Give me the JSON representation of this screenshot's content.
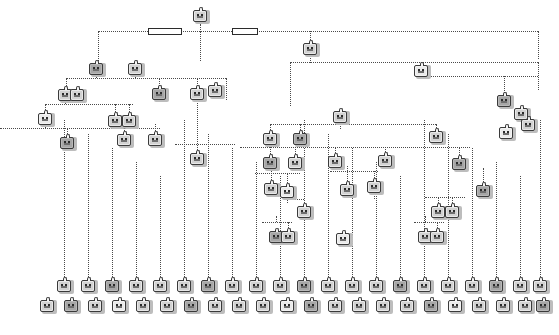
{
  "diagram": {
    "kind": "tree",
    "node_icon": "briefcase-face-icon",
    "connector_style": "dotted",
    "colors": {
      "connector": "#4a4a4a",
      "node_border": "#3a3a3a",
      "node_fill": "#e8e8e8",
      "node_shadow": "#bdbdbd",
      "label_box_border": "#2b2b2b",
      "label_box_fill": "#ffffff",
      "background": "#ffffff",
      "caption": "#8d8d8d"
    },
    "counts": {
      "total_nodes": 118,
      "leaf_row_upper": 21,
      "leaf_row_lower": 22,
      "label_boxes": 2
    },
    "label_boxes": [
      {
        "x": 148,
        "y": 28,
        "w": 34,
        "h": 7,
        "text": ""
      },
      {
        "x": 232,
        "y": 28,
        "w": 26,
        "h": 7,
        "text": ""
      }
    ],
    "nodes": [
      {
        "id": "n0",
        "x": 193,
        "y": 7,
        "v": ""
      },
      {
        "id": "n1",
        "x": 303,
        "y": 40,
        "v": ""
      },
      {
        "id": "n2",
        "x": 89,
        "y": 60,
        "v": ""
      },
      {
        "id": "n3",
        "x": 128,
        "y": 60,
        "v": ""
      },
      {
        "id": "n4",
        "x": 414,
        "y": 62,
        "v": ""
      },
      {
        "id": "n5",
        "x": 58,
        "y": 86,
        "v": ""
      },
      {
        "id": "n6",
        "x": 70,
        "y": 86,
        "v": ""
      },
      {
        "id": "n7",
        "x": 152,
        "y": 85,
        "v": ""
      },
      {
        "id": "n8",
        "x": 190,
        "y": 85,
        "v": ""
      },
      {
        "id": "n9",
        "x": 208,
        "y": 82,
        "v": ""
      },
      {
        "id": "n10",
        "x": 333,
        "y": 108,
        "v": ""
      },
      {
        "id": "n11",
        "x": 497,
        "y": 92,
        "v": ""
      },
      {
        "id": "n12",
        "x": 514,
        "y": 105,
        "v": ""
      },
      {
        "id": "n13",
        "x": 38,
        "y": 110,
        "v": ""
      },
      {
        "id": "n14",
        "x": 108,
        "y": 112,
        "v": ""
      },
      {
        "id": "n15",
        "x": 122,
        "y": 112,
        "v": ""
      },
      {
        "id": "n16",
        "x": 60,
        "y": 134,
        "v": ""
      },
      {
        "id": "n17",
        "x": 117,
        "y": 131,
        "v": ""
      },
      {
        "id": "n18",
        "x": 148,
        "y": 131,
        "v": ""
      },
      {
        "id": "n19",
        "x": 263,
        "y": 130,
        "v": ""
      },
      {
        "id": "n20",
        "x": 293,
        "y": 130,
        "v": ""
      },
      {
        "id": "n21",
        "x": 429,
        "y": 128,
        "v": ""
      },
      {
        "id": "n22",
        "x": 499,
        "y": 124,
        "v": ""
      },
      {
        "id": "n23",
        "x": 521,
        "y": 116,
        "v": ""
      },
      {
        "id": "n24",
        "x": 190,
        "y": 150,
        "v": ""
      },
      {
        "id": "n25",
        "x": 263,
        "y": 154,
        "v": ""
      },
      {
        "id": "n26",
        "x": 288,
        "y": 154,
        "v": ""
      },
      {
        "id": "n27",
        "x": 328,
        "y": 153,
        "v": ""
      },
      {
        "id": "n28",
        "x": 378,
        "y": 152,
        "v": ""
      },
      {
        "id": "n29",
        "x": 452,
        "y": 155,
        "v": ""
      },
      {
        "id": "n30",
        "x": 264,
        "y": 180,
        "v": ""
      },
      {
        "id": "n31",
        "x": 280,
        "y": 183,
        "v": ""
      },
      {
        "id": "n32",
        "x": 340,
        "y": 181,
        "v": ""
      },
      {
        "id": "n33",
        "x": 367,
        "y": 178,
        "v": ""
      },
      {
        "id": "n34",
        "x": 476,
        "y": 182,
        "v": ""
      },
      {
        "id": "n35",
        "x": 297,
        "y": 203,
        "v": ""
      },
      {
        "id": "n36",
        "x": 431,
        "y": 203,
        "v": ""
      },
      {
        "id": "n37",
        "x": 445,
        "y": 203,
        "v": ""
      },
      {
        "id": "n38",
        "x": 269,
        "y": 228,
        "v": ""
      },
      {
        "id": "n39",
        "x": 281,
        "y": 228,
        "v": ""
      },
      {
        "id": "n40",
        "x": 336,
        "y": 230,
        "v": ""
      },
      {
        "id": "n41",
        "x": 418,
        "y": 228,
        "v": ""
      },
      {
        "id": "n42",
        "x": 430,
        "y": 228,
        "v": ""
      }
    ],
    "leaf_row_upper_y": 277,
    "leaf_row_lower_y": 297,
    "leaf_row_upper_x": [
      57,
      81,
      105,
      129,
      153,
      177,
      201,
      225,
      249,
      273,
      297,
      321,
      345,
      369,
      393,
      417,
      441,
      465,
      489,
      513,
      533
    ],
    "leaf_row_lower_x": [
      40,
      64,
      88,
      112,
      136,
      160,
      184,
      208,
      232,
      256,
      280,
      304,
      328,
      352,
      376,
      400,
      424,
      448,
      472,
      496,
      518,
      536
    ],
    "captions": [
      "",
      "",
      "",
      "",
      "",
      "",
      "",
      "",
      "",
      "",
      "",
      "",
      "",
      "",
      "",
      "",
      "",
      "",
      "",
      ""
    ]
  }
}
